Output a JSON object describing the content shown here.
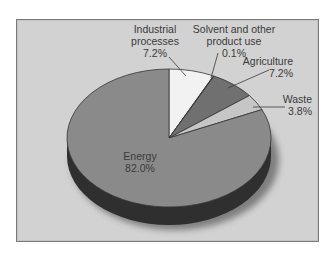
{
  "chart_data": {
    "type": "pie",
    "title": "",
    "style": "3d",
    "start": "top",
    "direction": "clockwise",
    "slices": [
      {
        "name": "Industrial processes",
        "label_lines": [
          "Industrial",
          "processes",
          "7.2%"
        ],
        "value": 7.2,
        "color": "#f2f2f2"
      },
      {
        "name": "Solvent and other product use",
        "label_lines": [
          "Solvent and other",
          "product use",
          "0.1%"
        ],
        "value": 0.1,
        "color": "#6f6f6f"
      },
      {
        "name": "Agriculture",
        "label_lines": [
          "Agriculture",
          "7.2%"
        ],
        "value": 7.2,
        "color": "#707070"
      },
      {
        "name": "Waste",
        "label_lines": [
          "Waste",
          "3.8%"
        ],
        "value": 3.8,
        "color": "#c6c6c6"
      },
      {
        "name": "Energy",
        "label_lines": [
          "Energy",
          "82.0%"
        ],
        "value": 82.0,
        "color": "#8a8a8a"
      }
    ],
    "side_color": "#2f2f2f",
    "background_color": "#d2d2d2",
    "legend": "none"
  }
}
